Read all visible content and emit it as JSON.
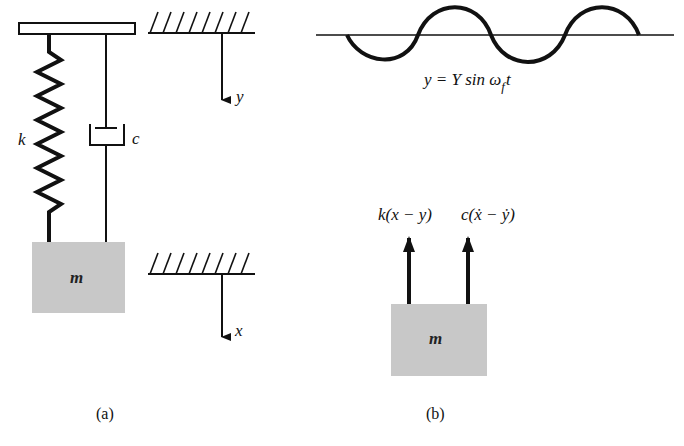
{
  "figure_a": {
    "caption": "(a)",
    "spring_label": "k",
    "damper_label": "c",
    "mass_label": "m",
    "support_displacement_label": "y",
    "mass_displacement_label": "x"
  },
  "figure_b": {
    "caption": "(b)",
    "excitation_equation": "y = Y sin ω",
    "excitation_subscript": "f",
    "excitation_suffix": "t",
    "spring_force_label": "k(x − y)",
    "damper_force_label": "c(ẋ − ẏ)",
    "mass_label": "m"
  },
  "colors": {
    "line": "#111111",
    "mass_fill": "#c8c8c8",
    "background": "#ffffff"
  }
}
